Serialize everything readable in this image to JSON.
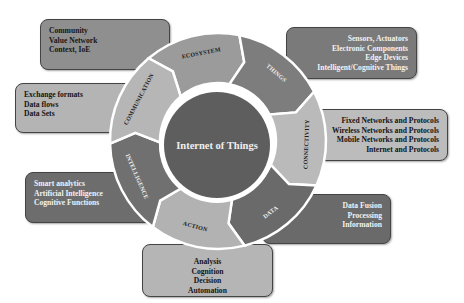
{
  "diagram": {
    "title": "Internet of Things",
    "colors": {
      "core": "#5e5e5e",
      "ring_border": "#ffffff",
      "ecosystem": "#9b9b9b",
      "things": "#7d7d7d",
      "connectivity": "#bababa",
      "data": "#6a6a6a",
      "action": "#b2b2b2",
      "intelligence": "#707070",
      "communication": "#b6b6b6"
    },
    "segments": [
      {
        "id": "ecosystem",
        "label": "ECOSYSTEM",
        "items": [
          "Community",
          "Value Network",
          "Context, IoE"
        ]
      },
      {
        "id": "things",
        "label": "THINGS",
        "items": [
          "Sensors, Actuators",
          "Electronic Components",
          "Edge Devices",
          "Intelligent/Cognitive Things"
        ]
      },
      {
        "id": "connectivity",
        "label": "CONNECTIVITY",
        "items": [
          "Fixed Networks and Protocols",
          "Wireless Networks and Protocols",
          "Mobile Networks and Protocols",
          "Internet and Protocols"
        ]
      },
      {
        "id": "data",
        "label": "DATA",
        "items": [
          "Data Fusion",
          "Processing",
          "Information"
        ]
      },
      {
        "id": "action",
        "label": "ACTION",
        "items": [
          "Analysis",
          "Cognition",
          "Decision",
          "Automation"
        ]
      },
      {
        "id": "intelligence",
        "label": "INTELLIGENCE",
        "items": [
          "Smart analytics",
          "Artificial Intelligence",
          "Cognitive Functions"
        ]
      },
      {
        "id": "communication",
        "label": "COMMUNICATION",
        "items": [
          "Exchange formats",
          "Data flows",
          "Data Sets"
        ]
      }
    ]
  }
}
